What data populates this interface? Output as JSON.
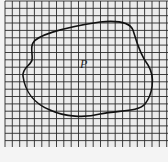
{
  "figure": {
    "label": "P",
    "grid": {
      "left": 5,
      "top": 1,
      "right": 168,
      "bottom": 147,
      "cell": 7.35,
      "line_color": "#2a2a2a",
      "background": "#ececec"
    },
    "region": {
      "name": "P",
      "stroke": "#111111",
      "path": "M33,43 C36,36 60,28 100,22 C120,20 130,23 133,30 C136,40 140,55 148,65 C156,78 152,95 145,104 C138,112 120,110 100,114 C85,118 65,117 50,110 C35,104 25,92 23,76 C22,68 31,65 32,60 C33,54 30,48 33,43 Z"
    },
    "label_position": {
      "x": 80,
      "y": 68
    }
  }
}
